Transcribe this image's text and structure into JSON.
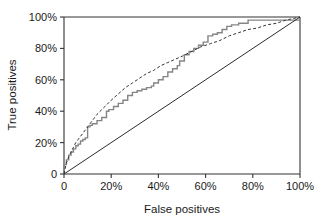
{
  "chart_data": {
    "type": "line",
    "title": "",
    "subtitle": "",
    "xlabel": "False positives",
    "ylabel": "True positives",
    "xlim": [
      0,
      100
    ],
    "ylim": [
      0,
      100
    ],
    "grid": false,
    "legend_position": "none",
    "x_tick_labels": [
      "0",
      "20%",
      "40%",
      "60%",
      "80%",
      "100%"
    ],
    "x_tick_values": [
      0,
      20,
      40,
      60,
      80,
      100
    ],
    "y_tick_labels": [
      "0",
      "20%",
      "40%",
      "60%",
      "80%",
      "100%"
    ],
    "y_tick_values": [
      0,
      20,
      40,
      60,
      80,
      100
    ],
    "colors": {
      "empirical_roc": "#858585",
      "fitted_roc": "#333333",
      "chance_line": "#2b2b2b",
      "axis": "#333333",
      "background": "#ffffff"
    },
    "series": [
      {
        "name": "Empirical ROC curve",
        "style": "step",
        "color": "#858585",
        "x": [
          0,
          0,
          1,
          1,
          2,
          2,
          3,
          3,
          4,
          4,
          5,
          5,
          6,
          6,
          7,
          7,
          8,
          8,
          9,
          9,
          10,
          10,
          11,
          11,
          12,
          12,
          14,
          14,
          16,
          16,
          18,
          18,
          19,
          19,
          21,
          21,
          23,
          23,
          25,
          25,
          27,
          27,
          29,
          29,
          31,
          31,
          33,
          33,
          35,
          35,
          37,
          37,
          38,
          38,
          40,
          40,
          42,
          42,
          44,
          44,
          46,
          46,
          48,
          48,
          49,
          49,
          51,
          51,
          53,
          53,
          55,
          55,
          57,
          57,
          59,
          59,
          61,
          61,
          63,
          63,
          65,
          65,
          67,
          67,
          69,
          69,
          71,
          71,
          74,
          74,
          78,
          78,
          100
        ],
        "y": [
          0,
          6,
          6,
          9,
          9,
          12,
          12,
          14,
          14,
          16,
          16,
          18,
          18,
          19,
          19,
          21,
          21,
          22,
          22,
          23,
          23,
          30,
          30,
          31,
          31,
          32,
          32,
          34,
          34,
          36,
          36,
          40,
          40,
          41,
          41,
          43,
          43,
          45,
          45,
          47,
          47,
          50,
          50,
          52,
          52,
          53,
          53,
          54,
          54,
          55,
          55,
          56,
          56,
          58,
          58,
          60,
          60,
          62,
          62,
          65,
          65,
          67,
          67,
          69,
          69,
          72,
          72,
          76,
          76,
          78,
          78,
          80,
          80,
          82,
          82,
          84,
          84,
          88,
          88,
          89,
          89,
          90,
          90,
          92,
          92,
          94,
          94,
          95,
          95,
          96,
          96,
          98,
          98
        ]
      },
      {
        "name": "Fitted (smooth) ROC curve",
        "style": "dashed",
        "color": "#333333",
        "x": [
          0,
          1,
          2,
          3,
          4,
          5,
          6,
          8,
          10,
          12,
          14,
          16,
          18,
          20,
          23,
          26,
          29,
          32,
          35,
          38,
          41,
          44,
          47,
          50,
          54,
          58,
          62,
          66,
          70,
          74,
          78,
          82,
          86,
          90,
          94,
          97,
          100
        ],
        "y": [
          0,
          7,
          11,
          14,
          17,
          20,
          22,
          26,
          30,
          34,
          38,
          41,
          44,
          47,
          51,
          55,
          58,
          61,
          64,
          66,
          69,
          71,
          73,
          75,
          78,
          81,
          83,
          85,
          88,
          90,
          92,
          93,
          95,
          96,
          98,
          99,
          100
        ]
      },
      {
        "name": "Chance diagonal",
        "style": "solid",
        "color": "#2b2b2b",
        "x": [
          0,
          100
        ],
        "y": [
          0,
          100
        ]
      }
    ]
  }
}
